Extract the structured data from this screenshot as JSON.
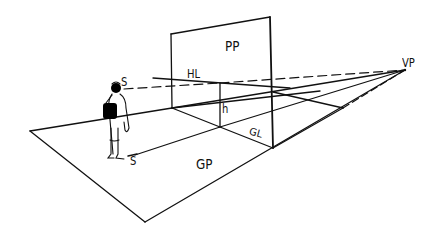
{
  "diagram": {
    "title": "",
    "type": "perspective-projection-sketch",
    "labels": {
      "picture_plane": "PP",
      "horizon_line": "HL",
      "station_point_eye": "S",
      "station_point_ground": "S",
      "height": "h",
      "ground_line": "GL",
      "ground_plane": "GP",
      "vanishing_point": "VP"
    },
    "elements": [
      {
        "id": "picture-plane",
        "label": "PP",
        "kind": "vertical plane"
      },
      {
        "id": "horizon-line",
        "label": "HL",
        "kind": "line"
      },
      {
        "id": "sight-line",
        "kind": "dashed line",
        "from": "S",
        "to": "VP"
      },
      {
        "id": "eye-height",
        "label": "h",
        "kind": "vertical segment"
      },
      {
        "id": "ground-line",
        "label": "GL",
        "kind": "line"
      },
      {
        "id": "ground-plane",
        "label": "GP",
        "kind": "plane"
      },
      {
        "id": "observer",
        "kind": "figure with backpack"
      },
      {
        "id": "vanishing-point",
        "label": "VP",
        "kind": "point"
      }
    ],
    "colors": {
      "ink": "#111111",
      "background": "#ffffff"
    }
  }
}
